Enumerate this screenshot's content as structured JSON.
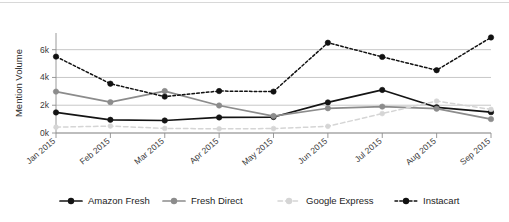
{
  "chart_data": {
    "type": "line",
    "title": "",
    "xlabel": "",
    "ylabel": "Mention Volume",
    "categories": [
      "Jan 2015",
      "Feb 2015",
      "Mar 2015",
      "Apr 2015",
      "May 2015",
      "Jun 2015",
      "Jul 2015",
      "Aug 2015",
      "Sep 2015"
    ],
    "ylim": [
      0,
      7200
    ],
    "yticks": [
      0,
      2000,
      4000,
      6000
    ],
    "ytick_labels": [
      "0k",
      "2k",
      "4k",
      "6k"
    ],
    "grid": true,
    "legend_position": "bottom",
    "series": [
      {
        "name": "Amazon Fresh",
        "color": "#141414",
        "style": "solid",
        "marker": "circle",
        "values": [
          1480,
          950,
          900,
          1120,
          1150,
          2200,
          3100,
          1850,
          1500
        ]
      },
      {
        "name": "Fresh Direct",
        "color": "#8c8c8c",
        "style": "solid",
        "marker": "circle",
        "values": [
          2980,
          2220,
          3020,
          1980,
          1220,
          1780,
          1900,
          1750,
          1000
        ]
      },
      {
        "name": "Google Express",
        "color": "#d5d5d5",
        "style": "dashed",
        "marker": "circle",
        "values": [
          420,
          500,
          330,
          300,
          320,
          480,
          1400,
          2300,
          1700
        ]
      },
      {
        "name": "Instacart",
        "color": "#111111",
        "style": "dotted",
        "marker": "circle",
        "values": [
          5500,
          3550,
          2620,
          3020,
          2980,
          6500,
          5480,
          4520,
          6880
        ]
      }
    ]
  },
  "legend": {
    "items": [
      {
        "label": "Amazon Fresh"
      },
      {
        "label": "Fresh Direct"
      },
      {
        "label": "Google Express"
      },
      {
        "label": "Instacart"
      }
    ]
  }
}
